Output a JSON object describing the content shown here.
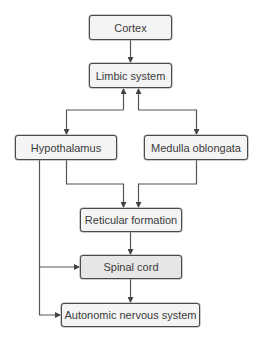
{
  "diagram": {
    "type": "flowchart",
    "colors": {
      "node_fill": "#f4f4f4",
      "node_fill_highlight": "#e6e6e6",
      "border": "#4a4a4a",
      "arrow": "#444444",
      "text": "#3a3a3a"
    },
    "nodes": {
      "cortex": "Cortex",
      "limbic": "Limbic system",
      "hypothalamus": "Hypothalamus",
      "medulla": "Medulla oblongata",
      "reticular": "Reticular formation",
      "spinal": "Spinal cord",
      "autonomic": "Autonomic nervous system"
    },
    "edges": [
      {
        "from": "Cortex",
        "to": "Limbic system"
      },
      {
        "from": "Limbic system",
        "to": "Hypothalamus",
        "bidirectional": true
      },
      {
        "from": "Limbic system",
        "to": "Medulla oblongata",
        "bidirectional": true
      },
      {
        "from": "Hypothalamus",
        "to": "Reticular formation"
      },
      {
        "from": "Medulla oblongata",
        "to": "Reticular formation"
      },
      {
        "from": "Reticular formation",
        "to": "Spinal cord"
      },
      {
        "from": "Hypothalamus",
        "to": "Spinal cord"
      },
      {
        "from": "Spinal cord",
        "to": "Autonomic nervous system"
      },
      {
        "from": "Hypothalamus",
        "to": "Autonomic nervous system"
      }
    ]
  }
}
